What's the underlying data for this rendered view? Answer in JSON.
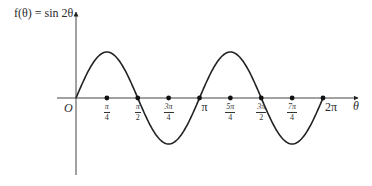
{
  "chart_data": {
    "type": "line",
    "title": "",
    "function": "f(θ) = sin 2θ",
    "ylabel": "f(θ) = sin 2θ",
    "xlabel": "θ",
    "origin_label": "O",
    "x_ticks": [
      {
        "value": 0.7854,
        "label": "π/4",
        "num": "π",
        "den": "4"
      },
      {
        "value": 1.5708,
        "label": "π/2",
        "num": "π",
        "den": "2"
      },
      {
        "value": 2.3562,
        "label": "3π/4",
        "num": "3π",
        "den": "4"
      },
      {
        "value": 3.1416,
        "label": "π"
      },
      {
        "value": 3.927,
        "label": "5π/4",
        "num": "5π",
        "den": "4"
      },
      {
        "value": 4.7124,
        "label": "3π/2",
        "num": "3π",
        "den": "2"
      },
      {
        "value": 5.4978,
        "label": "7π/4",
        "num": "7π",
        "den": "4"
      },
      {
        "value": 6.2832,
        "label": "2π"
      }
    ],
    "xlim": [
      -0.6,
      9.0
    ],
    "ylim": [
      -2.5,
      2.8
    ],
    "series": [
      {
        "name": "sin 2θ",
        "x": [
          0,
          0.3927,
          0.7854,
          1.1781,
          1.5708,
          1.9635,
          2.3562,
          2.7489,
          3.1416,
          3.5343,
          3.927,
          4.3197,
          4.7124,
          5.1051,
          5.4978,
          5.8905,
          6.2832
        ],
        "y": [
          0,
          0.7071,
          1,
          0.7071,
          0,
          -0.7071,
          -1,
          -0.7071,
          0,
          0.7071,
          1,
          0.7071,
          0,
          -0.7071,
          -1,
          -0.7071,
          0
        ]
      }
    ],
    "grid": false,
    "legend": "none"
  }
}
